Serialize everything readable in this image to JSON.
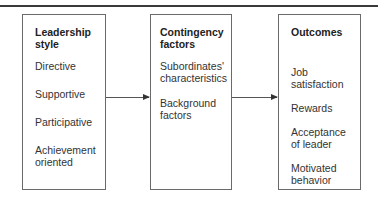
{
  "diagram": {
    "type": "flow",
    "boxes": [
      {
        "title": "Leadership style",
        "title_lines": [
          "Leadership",
          "style"
        ],
        "items": [
          "Directive",
          "Supportive",
          "Participative",
          "Achievement oriented"
        ],
        "item_lines": [
          [
            "Directive"
          ],
          [
            "Supportive"
          ],
          [
            "Participative"
          ],
          [
            "Achievement",
            "oriented"
          ]
        ]
      },
      {
        "title": "Contingency factors",
        "title_lines": [
          "Contingency",
          "factors"
        ],
        "items": [
          "Subordinates' characteristics",
          "Background factors"
        ],
        "item_lines": [
          [
            "Subordinates'",
            "characteristics"
          ],
          [
            "Background",
            "factors"
          ]
        ]
      },
      {
        "title": "Outcomes",
        "title_lines": [
          "Outcomes"
        ],
        "items": [
          "Job satisfaction",
          "Rewards",
          "Acceptance of leader",
          "Motivated behavior"
        ],
        "item_lines": [
          [
            "Job",
            "satisfaction"
          ],
          [
            "Rewards"
          ],
          [
            "Acceptance",
            "of leader"
          ],
          [
            "Motivated",
            "behavior"
          ]
        ]
      }
    ],
    "edges": [
      {
        "from": "Leadership style",
        "to": "Contingency factors",
        "direction": "right"
      },
      {
        "from": "Contingency factors",
        "to": "Outcomes",
        "direction": "right"
      }
    ],
    "colors": {
      "border": "#6a6a6a",
      "text": "#2a2a2a",
      "rule": "#3a3a3a",
      "arrow": "#555555"
    }
  }
}
